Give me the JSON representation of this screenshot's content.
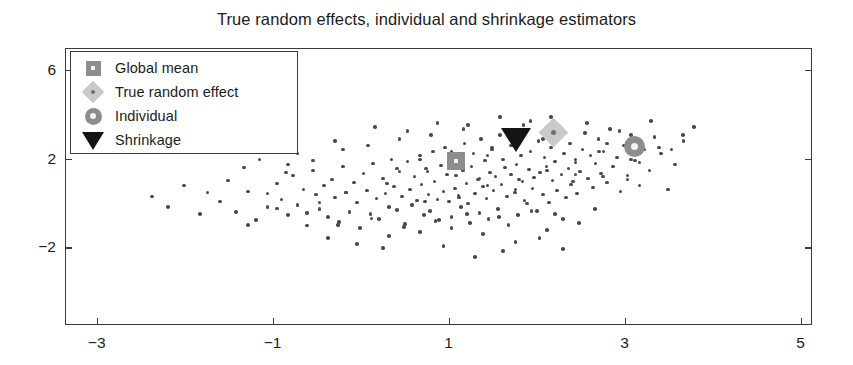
{
  "chart_data": {
    "type": "scatter",
    "title": "True random effects, individual and shrinkage estimators",
    "xlabel": "",
    "ylabel": "",
    "xlim": [
      -3.36,
      5.13
    ],
    "ylim": [
      -5.5,
      7.0
    ],
    "xticks": [
      -3,
      -1,
      1,
      3,
      5
    ],
    "xticklabels": [
      "-3",
      "-1",
      "1",
      "3",
      "5"
    ],
    "yticks": [
      6,
      2,
      -2
    ],
    "yticklabels": [
      "6",
      "2",
      "-2"
    ],
    "grid": false,
    "legend_position": "upper left",
    "legend": [
      {
        "label": "Global mean",
        "marker": "square",
        "color": "#8d8d8d"
      },
      {
        "label": "True random effect",
        "marker": "diamond",
        "color": "#c9c9c9"
      },
      {
        "label": "Individual",
        "marker": "circle",
        "color": "#8d8d8d"
      },
      {
        "label": "Shrinkage",
        "marker": "triangle-down",
        "color": "#141414"
      }
    ],
    "highlight_points": [
      {
        "name": "Global mean",
        "marker": "square",
        "color": "#8d8d8d",
        "x": 1.07,
        "y": 1.93
      },
      {
        "name": "Shrinkage",
        "marker": "triangle-down",
        "color": "#141414",
        "x": 1.76,
        "y": 2.93
      },
      {
        "name": "True random effect",
        "marker": "diamond",
        "color": "#c9c9c9",
        "x": 2.18,
        "y": 3.25
      },
      {
        "name": "Individual",
        "marker": "circle",
        "color": "#8d8d8d",
        "x": 3.1,
        "y": 2.58
      }
    ],
    "series": [
      {
        "name": "sample cloud",
        "marker": "dot",
        "color": "#4a4a4a",
        "points": [
          [
            -1.52,
            1.07
          ],
          [
            -1.43,
            -0.36
          ],
          [
            -1.29,
            0.57
          ],
          [
            -1.2,
            -0.73
          ],
          [
            -1.07,
            -0.14
          ],
          [
            -0.96,
            0.93
          ],
          [
            -0.91,
            0.2
          ],
          [
            -0.84,
            -0.5
          ],
          [
            -0.78,
            1.29
          ],
          [
            -0.73,
            -0.05
          ],
          [
            -0.66,
            0.66
          ],
          [
            -0.62,
            -0.96
          ],
          [
            -0.55,
            1.52
          ],
          [
            -0.52,
            0.43
          ],
          [
            -0.48,
            -0.23
          ],
          [
            -0.43,
            0.84
          ],
          [
            -0.38,
            -0.59
          ],
          [
            -0.34,
            1.11
          ],
          [
            -0.3,
            0.29
          ],
          [
            -0.26,
            -0.82
          ],
          [
            -0.21,
            1.7
          ],
          [
            -0.18,
            0.52
          ],
          [
            -0.14,
            -0.36
          ],
          [
            -0.09,
            0.98
          ],
          [
            -0.05,
            0.07
          ],
          [
            -0.02,
            -1.07
          ],
          [
            0.02,
            1.38
          ],
          [
            0.06,
            0.61
          ],
          [
            0.1,
            -0.45
          ],
          [
            0.13,
            1.84
          ],
          [
            0.17,
            0.25
          ],
          [
            0.2,
            -0.68
          ],
          [
            0.24,
            1.16
          ],
          [
            0.27,
            0.48
          ],
          [
            0.31,
            -0.14
          ],
          [
            0.34,
            2.02
          ],
          [
            0.37,
            0.79
          ],
          [
            0.4,
            -0.27
          ],
          [
            0.43,
            1.47
          ],
          [
            0.46,
            0.34
          ],
          [
            0.49,
            -0.91
          ],
          [
            0.52,
            1.93
          ],
          [
            0.55,
            0.66
          ],
          [
            0.57,
            -0.05
          ],
          [
            0.6,
            1.25
          ],
          [
            0.63,
            0.16
          ],
          [
            0.66,
            2.2
          ],
          [
            0.68,
            0.88
          ],
          [
            0.71,
            -0.5
          ],
          [
            0.73,
            1.61
          ],
          [
            0.76,
            0.43
          ],
          [
            0.78,
            -0.32
          ],
          [
            0.81,
            2.38
          ],
          [
            0.83,
            1.02
          ],
          [
            0.86,
            0.2
          ],
          [
            0.88,
            -0.73
          ],
          [
            0.9,
            1.75
          ],
          [
            0.93,
            0.57
          ],
          [
            0.95,
            2.56
          ],
          [
            0.97,
            1.34
          ],
          [
            0.99,
            0.11
          ],
          [
            1.02,
            -0.59
          ],
          [
            1.04,
            1.88
          ],
          [
            1.06,
            0.7
          ],
          [
            1.08,
            2.11
          ],
          [
            1.1,
            0.38
          ],
          [
            1.13,
            -0.14
          ],
          [
            1.15,
            1.52
          ],
          [
            1.17,
            2.74
          ],
          [
            1.19,
            0.93
          ],
          [
            1.21,
            0.02
          ],
          [
            1.23,
            -0.86
          ],
          [
            1.25,
            1.7
          ],
          [
            1.27,
            2.29
          ],
          [
            1.29,
            0.48
          ],
          [
            1.32,
            1.11
          ],
          [
            1.34,
            -0.41
          ],
          [
            1.36,
            2.93
          ],
          [
            1.38,
            0.79
          ],
          [
            1.4,
            1.97
          ],
          [
            1.42,
            0.25
          ],
          [
            1.44,
            -0.68
          ],
          [
            1.46,
            1.43
          ],
          [
            1.48,
            2.47
          ],
          [
            1.5,
            0.61
          ],
          [
            1.52,
            1.25
          ],
          [
            1.55,
            -0.23
          ],
          [
            1.57,
            3.11
          ],
          [
            1.59,
            0.88
          ],
          [
            1.61,
            2.02
          ],
          [
            1.63,
            1.66
          ],
          [
            1.65,
            0.34
          ],
          [
            1.67,
            -0.95
          ],
          [
            1.7,
            1.34
          ],
          [
            1.72,
            2.65
          ],
          [
            1.74,
            0.52
          ],
          [
            1.76,
            1.79
          ],
          [
            1.78,
            -0.5
          ],
          [
            1.81,
            2.2
          ],
          [
            1.83,
            1.02
          ],
          [
            1.85,
            0.16
          ],
          [
            1.87,
            3.29
          ],
          [
            1.9,
            1.56
          ],
          [
            1.92,
            2.38
          ],
          [
            1.94,
            0.7
          ],
          [
            1.96,
            1.2
          ],
          [
            1.99,
            -0.32
          ],
          [
            2.01,
            2.84
          ],
          [
            2.03,
            1.43
          ],
          [
            2.06,
            0.43
          ],
          [
            2.08,
            2.11
          ],
          [
            2.1,
            1.7
          ],
          [
            2.13,
            0.07
          ],
          [
            2.15,
            2.56
          ],
          [
            2.17,
            1.07
          ],
          [
            2.2,
            1.93
          ],
          [
            2.22,
            0.61
          ],
          [
            2.25,
            3.02
          ],
          [
            2.27,
            1.34
          ],
          [
            2.3,
            2.29
          ],
          [
            2.32,
            0.29
          ],
          [
            2.35,
            1.61
          ],
          [
            2.37,
            2.74
          ],
          [
            2.4,
            1.02
          ],
          [
            2.43,
            2.02
          ],
          [
            2.45,
            0.48
          ],
          [
            2.48,
            1.48
          ],
          [
            2.51,
            2.47
          ],
          [
            2.54,
            3.2
          ],
          [
            2.57,
            1.16
          ],
          [
            2.6,
            2.2
          ],
          [
            2.63,
            0.75
          ],
          [
            2.66,
            1.84
          ],
          [
            2.69,
            2.93
          ],
          [
            2.72,
            1.38
          ],
          [
            2.75,
            2.38
          ],
          [
            2.79,
            0.98
          ],
          [
            2.82,
            3.38
          ],
          [
            2.86,
            1.7
          ],
          [
            2.9,
            2.11
          ],
          [
            2.94,
            0.57
          ],
          [
            2.98,
            2.65
          ],
          [
            3.02,
            1.29
          ],
          [
            3.06,
            3.11
          ],
          [
            3.11,
            1.97
          ],
          [
            3.16,
            0.84
          ],
          [
            3.21,
            2.47
          ],
          [
            3.27,
            1.52
          ],
          [
            3.33,
            3.02
          ],
          [
            3.4,
            2.29
          ],
          [
            3.48,
            0.66
          ],
          [
            3.56,
            1.79
          ],
          [
            3.66,
            2.84
          ],
          [
            3.78,
            3.47
          ],
          [
            0.15,
            3.47
          ],
          [
            0.52,
            3.29
          ],
          [
            0.86,
            3.65
          ],
          [
            1.21,
            3.56
          ],
          [
            1.57,
            3.93
          ],
          [
            1.92,
            3.74
          ],
          [
            -0.21,
            2.47
          ],
          [
            -0.55,
            1.97
          ],
          [
            -0.86,
            1.43
          ],
          [
            -1.07,
            0.48
          ],
          [
            -1.34,
            1.66
          ],
          [
            -1.61,
            0.11
          ],
          [
            -1.84,
            -0.45
          ],
          [
            -2.02,
            0.84
          ],
          [
            -2.2,
            -0.14
          ],
          [
            -2.38,
            0.34
          ],
          [
            0.31,
            -1.43
          ],
          [
            0.66,
            -1.25
          ],
          [
            1.02,
            -1.07
          ],
          [
            1.38,
            -1.34
          ],
          [
            1.75,
            -1.7
          ],
          [
            2.11,
            -1.16
          ],
          [
            2.47,
            -0.86
          ],
          [
            0.93,
            -1.88
          ],
          [
            1.61,
            -2.11
          ],
          [
            2.02,
            -1.52
          ],
          [
            -0.38,
            -1.52
          ],
          [
            -0.05,
            -1.79
          ],
          [
            0.24,
            -1.97
          ],
          [
            1.29,
            -2.38
          ],
          [
            2.29,
            -2.02
          ],
          [
            -1.16,
            2.02
          ],
          [
            -0.73,
            2.29
          ],
          [
            -0.3,
            2.84
          ],
          [
            0.07,
            2.65
          ],
          [
            0.43,
            2.93
          ],
          [
            0.79,
            3.11
          ],
          [
            1.16,
            3.38
          ],
          [
            1.48,
            2.56
          ],
          [
            1.84,
            3.56
          ],
          [
            2.15,
            3.93
          ],
          [
            2.56,
            3.65
          ],
          [
            2.93,
            3.29
          ],
          [
            3.29,
            3.74
          ],
          [
            3.65,
            3.11
          ],
          [
            -0.48,
            0.07
          ],
          [
            -0.18,
            0.52
          ],
          [
            0.29,
            0.93
          ],
          [
            0.75,
            1.47
          ],
          [
            1.11,
            0.29
          ],
          [
            1.43,
            0.84
          ],
          [
            1.79,
            1.11
          ],
          [
            2.11,
            1.52
          ],
          [
            2.43,
            1.88
          ],
          [
            2.74,
            1.25
          ],
          [
            3.06,
            2.02
          ],
          [
            -0.96,
            -0.2
          ],
          [
            -0.62,
            -0.41
          ],
          [
            -0.27,
            -0.95
          ],
          [
            0.11,
            -0.64
          ],
          [
            0.48,
            -1.02
          ],
          [
            0.84,
            -0.77
          ],
          [
            1.2,
            -0.45
          ],
          [
            1.56,
            -0.59
          ],
          [
            1.93,
            -0.32
          ],
          [
            2.29,
            -0.68
          ],
          [
            2.65,
            -0.23
          ],
          [
            0.66,
            2.02
          ],
          [
            1.02,
            2.38
          ],
          [
            1.34,
            1.16
          ],
          [
            1.7,
            2.65
          ],
          [
            2.06,
            2.93
          ],
          [
            2.38,
            0.88
          ],
          [
            2.7,
            2.38
          ],
          [
            3.02,
            1.11
          ],
          [
            3.38,
            2.56
          ],
          [
            -1.75,
            0.52
          ],
          [
            -1.29,
            -0.95
          ],
          [
            -0.84,
            1.79
          ],
          [
            1.88,
            0.02
          ],
          [
            2.2,
            -0.45
          ],
          [
            0.4,
            1.61
          ],
          [
            0.72,
            0.11
          ],
          [
            1.07,
            1.29
          ],
          [
            1.43,
            2.2
          ],
          [
            1.75,
            0.66
          ],
          [
            2.11,
            3.2
          ],
          [
            2.43,
            1.34
          ],
          [
            2.79,
            2.74
          ],
          [
            3.16,
            1.88
          ],
          [
            3.52,
            2.47
          ]
        ]
      }
    ]
  }
}
